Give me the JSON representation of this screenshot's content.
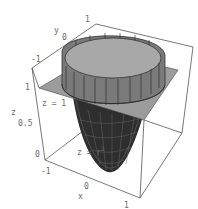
{
  "figure": {
    "annotations": {
      "plane_label": "z = 1",
      "surface_label": "z = r",
      "surface_exp": "2"
    },
    "axes": {
      "x": {
        "label": "x",
        "ticks": [
          "-1",
          "0",
          "1"
        ]
      },
      "y": {
        "label": "y",
        "ticks": [
          "-1",
          "0",
          "1"
        ]
      },
      "z": {
        "label": "z",
        "ticks": [
          "0",
          "0.5",
          "1"
        ]
      }
    },
    "colors": {
      "plane": "#9a9a9a",
      "surface_dark": "#2a2a2a",
      "cylinder": "#8a8a8a",
      "box": "#555555",
      "text": "#6a6a6a"
    }
  }
}
